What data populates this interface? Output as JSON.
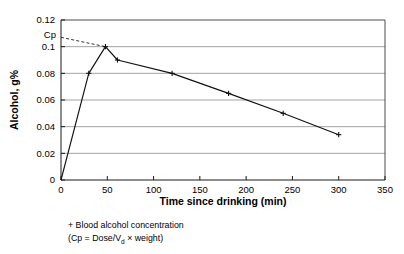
{
  "chart_data": {
    "type": "line",
    "title": "",
    "xlabel": "Time since drinking (min)",
    "ylabel": "Alcohol, g%",
    "xlim": [
      0,
      350
    ],
    "ylim": [
      0,
      0.12
    ],
    "xticks": [
      0,
      50,
      100,
      150,
      200,
      250,
      300,
      350
    ],
    "xtick_labels": [
      "0",
      "50",
      "100",
      "150",
      "200",
      "250",
      "300",
      "350"
    ],
    "yticks": [
      0,
      0.02,
      0.04,
      0.06,
      0.08,
      0.1,
      0.12
    ],
    "ytick_labels": [
      "0",
      "0.02",
      "0.04",
      "0.06",
      "0.08",
      "0.1",
      "0.12"
    ],
    "grid": "horizontal",
    "legend": "none",
    "series": [
      {
        "name": "Blood alcohol concentration",
        "marker": "plus",
        "x": [
          0,
          30,
          48,
          61,
          120,
          181,
          240,
          300
        ],
        "values": [
          0,
          0.08,
          0.1,
          0.09,
          0.08,
          0.065,
          0.05,
          0.034
        ]
      },
      {
        "name": "Cp extrapolation",
        "style": "dashed",
        "x": [
          0,
          48
        ],
        "values": [
          0.107,
          0.1
        ]
      }
    ],
    "annotations": [
      {
        "name": "cp-label",
        "text": "Cp",
        "x": 0,
        "y": 0.107
      }
    ]
  },
  "caption": {
    "line1": "+ Blood alcohol concentration",
    "line2_prefix": "(Cp = Dose/V",
    "line2_subscript": "d",
    "line2_suffix": " × weight)"
  },
  "colors": {
    "grid": "#8c8c8c",
    "frame": "#4d4d4d",
    "axis": "#1a1a1a",
    "data": "#111111",
    "cp_dash": "#333333",
    "background": "#ffffff"
  }
}
